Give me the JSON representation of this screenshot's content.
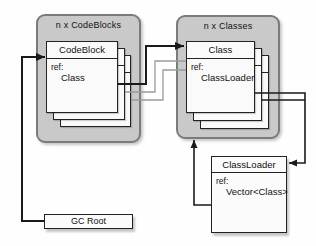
{
  "diagram": {
    "codeblocks_group": {
      "label": "n x CodeBlocks",
      "card": {
        "title": "CodeBlock",
        "ref_label": "ref:",
        "ref_value": "Class"
      }
    },
    "classes_group": {
      "label": "n x Classes",
      "card": {
        "title": "Class",
        "ref_label": "ref:",
        "ref_value": "ClassLoader"
      }
    },
    "classloader_box": {
      "title": "ClassLoader",
      "ref_label": "ref:",
      "ref_value": "Vector<Class>"
    },
    "gc_root_box": {
      "label": "GC Root"
    },
    "colors": {
      "container_fill": "#c9c9c9",
      "container_border": "#7b7b7b",
      "card_fill": "#fafafa",
      "edge_dark": "#1a1a1a",
      "edge_light": "#9a9a9a"
    },
    "edges": [
      {
        "name": "gc-root-to-codeblock",
        "points": [
          [
            44,
            221
          ],
          [
            22,
            221
          ],
          [
            22,
            57
          ],
          [
            45,
            57
          ]
        ],
        "color": "#1a1a1a",
        "width": 2,
        "arrow": true
      },
      {
        "name": "codeblock-ref-to-class",
        "points": [
          [
            118,
            84
          ],
          [
            146,
            84
          ],
          [
            146,
            46
          ],
          [
            184,
            46
          ]
        ],
        "color": "#1a1a1a",
        "width": 2,
        "arrow": true
      },
      {
        "name": "codeblock2-ref-to-class2",
        "points": [
          [
            125,
            92
          ],
          [
            155,
            92
          ],
          [
            155,
            61
          ],
          [
            186,
            61
          ]
        ],
        "color": "#9a9a9a",
        "width": 1.3,
        "arrow": false
      },
      {
        "name": "codeblock3-ref-to-class3",
        "points": [
          [
            131,
            100
          ],
          [
            163,
            100
          ],
          [
            163,
            70
          ],
          [
            186,
            70
          ]
        ],
        "color": "#9a9a9a",
        "width": 1.3,
        "arrow": false
      },
      {
        "name": "class-ref-to-classloader",
        "points": [
          [
            255,
            93
          ],
          [
            305,
            93
          ],
          [
            305,
            163
          ],
          [
            289,
            163
          ]
        ],
        "color": "#1a1a1a",
        "width": 1.6,
        "arrow": true
      },
      {
        "name": "class2-ref-to-classloader",
        "points": [
          [
            262,
            100
          ],
          [
            305,
            100
          ]
        ],
        "color": "#1a1a1a",
        "width": 1.6,
        "arrow": false
      },
      {
        "name": "classloader-ref-to-classes",
        "points": [
          [
            211,
            205
          ],
          [
            194,
            205
          ],
          [
            194,
            140
          ]
        ],
        "color": "#1a1a1a",
        "width": 1.6,
        "arrow": true
      }
    ]
  }
}
